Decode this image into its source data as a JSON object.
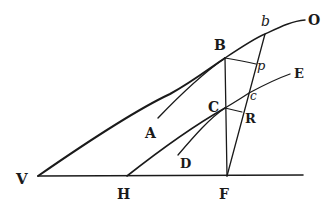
{
  "diagram": {
    "type": "geometric-figure",
    "labels": {
      "V": "V",
      "H": "H",
      "F": "F",
      "A": "A",
      "D": "D",
      "B": "B",
      "C": "C",
      "R": "R",
      "c": "c",
      "p": "p",
      "b": "b",
      "O": "O",
      "E": "E"
    },
    "points": {
      "V": [
        38,
        176
      ],
      "H": [
        127,
        176
      ],
      "F": [
        227,
        176
      ],
      "B": [
        225,
        58
      ],
      "C": [
        225,
        108
      ],
      "p": [
        256,
        64
      ],
      "R": [
        242,
        112
      ],
      "c": [
        249,
        93
      ],
      "b": [
        265,
        34
      ]
    },
    "curves": [
      {
        "name": "curve-AB-O",
        "from": "A",
        "through": [
          "B",
          "b"
        ],
        "to": "O"
      },
      {
        "name": "curve-DC-E",
        "from": "D",
        "through": [
          "C",
          "c"
        ],
        "to": "E"
      }
    ],
    "lines": [
      {
        "name": "baseline",
        "from": "V",
        "to": "F-extended"
      },
      {
        "name": "tangent-VB",
        "from": "V",
        "to": "B"
      },
      {
        "name": "tangent-HC",
        "from": "H",
        "to": "C"
      },
      {
        "name": "vertical-BF",
        "from": "B",
        "to": "F"
      },
      {
        "name": "line-Fb",
        "from": "F",
        "to": "b"
      },
      {
        "name": "perp-Bp",
        "from": "B",
        "to": "p"
      },
      {
        "name": "perp-CR",
        "from": "C",
        "to": "R"
      }
    ]
  }
}
